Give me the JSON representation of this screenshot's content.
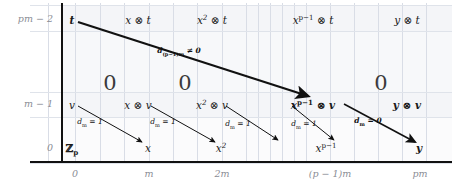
{
  "figure": {
    "type": "spectral-sequence-page-diagram"
  },
  "row_labels": [
    {
      "text": "pm − 2",
      "y": 19
    },
    {
      "text": "m − 1",
      "y": 104
    },
    {
      "text": "0",
      "y": 148
    }
  ],
  "column_labels": [
    {
      "text": "0",
      "x": 75
    },
    {
      "text": "m",
      "x": 149
    },
    {
      "text": "2m",
      "x": 222
    },
    {
      "text": "(p − 1)m",
      "x": 330
    },
    {
      "text": "pm",
      "x": 420
    }
  ],
  "row_top": {
    "label": "pm − 2",
    "cells": [
      {
        "html": "<i>t</i>",
        "x": 72,
        "bold": true
      },
      {
        "html": "<i>x</i> ⊗ <i>t</i>",
        "x": 138,
        "bold": false
      },
      {
        "html": "<i>x</i><sup>2</sup> ⊗ <i>t</i>",
        "x": 212,
        "bold": false
      },
      {
        "html": "<i>x</i><sup><span class=\"up\">p−1</span></sup> ⊗ <i>t</i>",
        "x": 313,
        "bold": false
      },
      {
        "html": "<i>y</i> ⊗ <i>t</i>",
        "x": 407,
        "bold": false
      }
    ]
  },
  "row_mid": {
    "label": "m − 1",
    "cells": [
      {
        "html": "<i>v</i>",
        "x": 72,
        "bold": false
      },
      {
        "html": "<i>x</i> ⊗ <i>v</i>",
        "x": 138,
        "bold": false
      },
      {
        "html": "<i>x</i><sup>2</sup> ⊗ <i>v</i>",
        "x": 212,
        "bold": false
      },
      {
        "html": "<i>x</i><sup><span class=\"up\">p−1</span></sup> ⊗ <i>v</i>",
        "x": 313,
        "bold": true
      },
      {
        "html": "<i>y</i> ⊗ <i>v</i>",
        "x": 407,
        "bold": true
      }
    ]
  },
  "row_bottom": {
    "label": "0",
    "cells": [
      {
        "html": "<span class=\"bb\">ℤ</span><sub><span class=\"up\">p</span></sub>",
        "x": 72,
        "bold": true
      },
      {
        "html": "<i>x</i>",
        "x": 148,
        "bold": false
      },
      {
        "html": "<i>x</i><sup>2</sup>",
        "x": 221,
        "bold": false
      },
      {
        "html": "<i>x</i><sup><span class=\"up\">p−1</span></sup>",
        "x": 326,
        "bold": false
      },
      {
        "html": "<i>y</i>",
        "x": 419,
        "bold": true
      }
    ]
  },
  "zeros": [
    {
      "text": "0",
      "x": 110,
      "y": 73
    },
    {
      "text": "0",
      "x": 185,
      "y": 73
    },
    {
      "text": "0",
      "x": 381,
      "y": 73
    }
  ],
  "arrows": [
    {
      "name": "long-differential",
      "label": "d<sub><span class=\"up\">(p−1)m</span></sub> ≠ 0",
      "label_x": 179,
      "label_y": 47,
      "x1": 78,
      "y1": 22,
      "x2": 308,
      "y2": 96,
      "bold": true,
      "width": 2.2
    },
    {
      "name": "d-m-1-a",
      "label": "d<sub><span class=\"up\">m</span></sub> = 1",
      "label_x": 90,
      "label_y": 118,
      "x1": 78,
      "y1": 106,
      "x2": 142,
      "y2": 142,
      "bold": false,
      "width": 1.0
    },
    {
      "name": "d-m-1-b",
      "label": "d<sub><span class=\"up\">m</span></sub> = 1",
      "label_x": 163,
      "label_y": 118,
      "x1": 151,
      "y1": 106,
      "x2": 215,
      "y2": 142,
      "bold": false,
      "width": 1.0
    },
    {
      "name": "d-m-1-c",
      "label": "d<sub><span class=\"up\">m</span></sub> = 1",
      "label_x": 238,
      "label_y": 120,
      "x1": 226,
      "y1": 106,
      "x2": 278,
      "y2": 140,
      "bold": false,
      "width": 1.0
    },
    {
      "name": "d-m-1-d",
      "label": "d<sub><span class=\"up\">m</span></sub> = 1",
      "label_x": 304,
      "label_y": 120,
      "x1": 292,
      "y1": 106,
      "x2": 334,
      "y2": 140,
      "bold": false,
      "width": 1.0
    },
    {
      "name": "d-m-0",
      "label": "d<sub><span class=\"up\">m</span></sub> = 0",
      "label_x": 368,
      "label_y": 117,
      "x1": 344,
      "y1": 104,
      "x2": 415,
      "y2": 142,
      "bold": true,
      "width": 1.6
    }
  ],
  "gridlines": {
    "vertical_x": [
      48,
      75,
      100,
      124,
      149,
      173,
      197,
      222,
      246,
      258,
      270,
      282,
      294,
      306,
      330,
      354,
      378,
      402,
      426
    ],
    "horizontal_y": [
      5,
      31,
      92,
      117,
      163
    ],
    "accent": "#d9dde6"
  },
  "axes": {
    "y_axis_x": 61,
    "x_axis_y": 161,
    "color": "#111111"
  }
}
